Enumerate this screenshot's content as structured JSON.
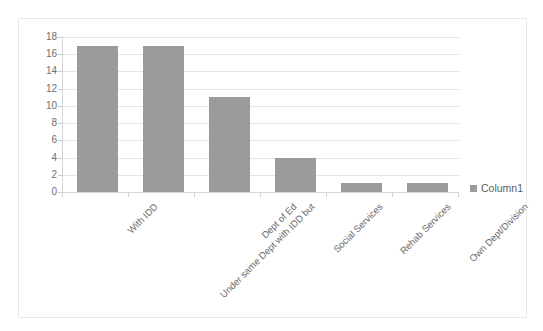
{
  "chart_data": {
    "type": "bar",
    "title": "",
    "xlabel": "",
    "ylabel": "",
    "categories": [
      "With IDD",
      "Under same Dept with IDD but",
      "Dept of Ed",
      "Social Services",
      "Rehab Services",
      "Own Dept/Division"
    ],
    "values": [
      17,
      17,
      11,
      4,
      1,
      1
    ],
    "series": [
      {
        "name": "Column1",
        "values": [
          17,
          17,
          11,
          4,
          1,
          1
        ]
      }
    ],
    "ylim": [
      0,
      18
    ],
    "ytick_labels": [
      "0",
      "2",
      "4",
      "6",
      "8",
      "10",
      "12",
      "14",
      "16",
      "18"
    ],
    "ytick_values": [
      0,
      2,
      4,
      6,
      8,
      10,
      12,
      14,
      16,
      18
    ],
    "grid": true,
    "legend": {
      "position": "right",
      "entries": [
        "Column1"
      ]
    },
    "bar_color": "#9b9b9b",
    "gridline_color": "#e4e4e4",
    "axis_color": "#d6d6d6",
    "frame_color": "#e8e8e8",
    "plot_background": "#ffffff"
  },
  "legend": {
    "label": "Column1"
  },
  "top_fragments": [
    "",
    "",
    ""
  ]
}
